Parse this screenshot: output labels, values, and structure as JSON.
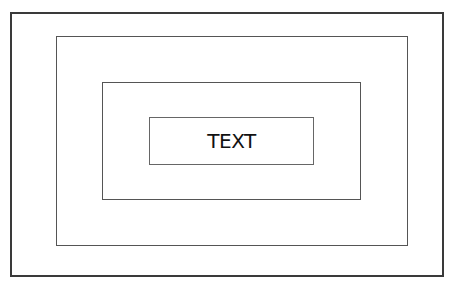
{
  "diagram": {
    "type": "nested-rectangles",
    "levels": 4,
    "center_label": "TEXT"
  }
}
